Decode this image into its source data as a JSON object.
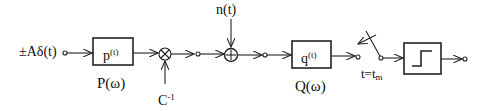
{
  "diagram": {
    "input_label": "±Aδ(t)",
    "blocks": [
      {
        "id": "p",
        "inner_main": "p",
        "inner_sup": "(t)",
        "caption": "P(ω)"
      },
      {
        "id": "q",
        "inner_main": "q",
        "inner_sup": "(t)",
        "caption": "Q(ω)"
      },
      {
        "id": "threshold",
        "icon": "step-function-icon"
      }
    ],
    "multiplier": {
      "symbol": "⊗",
      "input_label_main": "C",
      "input_label_sup": "-1"
    },
    "adder": {
      "symbol": "⊕",
      "input_label": "n(t)"
    },
    "switch": {
      "label_main": "t=t",
      "label_sub": "m"
    }
  }
}
